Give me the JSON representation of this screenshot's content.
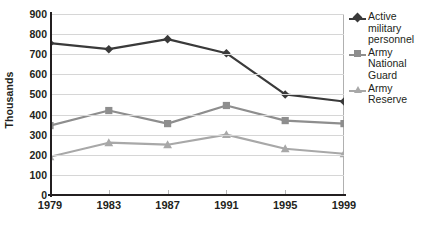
{
  "chart_data": {
    "type": "line",
    "title": "",
    "xlabel": "",
    "ylabel": "Thousands",
    "categories": [
      "1979",
      "1983",
      "1987",
      "1991",
      "1995",
      "1999"
    ],
    "x": [
      1979,
      1983,
      1987,
      1991,
      1995,
      1999
    ],
    "ylim": [
      0,
      900
    ],
    "ytick_step": 100,
    "yticks": [
      "0",
      "100",
      "200",
      "300",
      "400",
      "500",
      "600",
      "700",
      "800",
      "900"
    ],
    "grid": true,
    "legend_position": "right",
    "series": [
      {
        "name": "Active military personnel",
        "label_lines": "Active\nmilitary\npersonnel",
        "color": "#3a3a3a",
        "marker": "diamond",
        "values": [
          755,
          725,
          775,
          705,
          500,
          465
        ]
      },
      {
        "name": "Army National Guard",
        "label_lines": "Army\nNational\nGuard",
        "color": "#8e8e8e",
        "marker": "square",
        "values": [
          345,
          420,
          355,
          445,
          370,
          355
        ]
      },
      {
        "name": "Army Reserve",
        "label_lines": "Army\nReserve",
        "color": "#a8a8a8",
        "marker": "triangle",
        "values": [
          190,
          260,
          250,
          300,
          230,
          205
        ]
      }
    ]
  },
  "colors": {
    "text": "#231f20",
    "grid": "#d6d6d6",
    "axis": "#231f20",
    "plot_border": "#b0b0b0",
    "background": "#ffffff"
  }
}
